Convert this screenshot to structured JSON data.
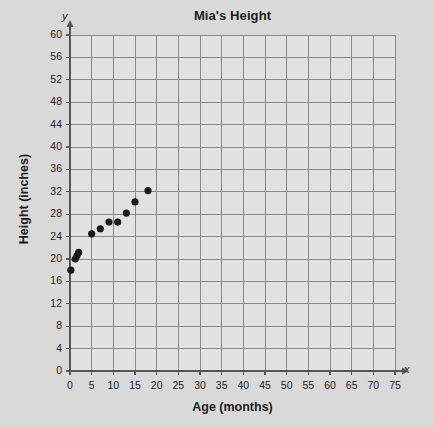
{
  "chart_data": {
    "type": "scatter",
    "title": "Mia's Height",
    "xlabel": "Age (months)",
    "ylabel": "Height (inches)",
    "xlim": [
      0,
      75
    ],
    "ylim": [
      0,
      60
    ],
    "xticks": [
      0,
      5,
      10,
      15,
      20,
      25,
      30,
      35,
      40,
      45,
      50,
      55,
      60,
      65,
      70,
      75
    ],
    "yticks": [
      0,
      4,
      8,
      12,
      16,
      20,
      24,
      28,
      32,
      36,
      40,
      44,
      48,
      52,
      56,
      60
    ],
    "grid": true,
    "legend": false,
    "x_axis_letter": "x",
    "y_axis_letter": "y",
    "series": [
      {
        "name": "Mia's Height",
        "marker_color": "#1a1a1a",
        "points": [
          {
            "x": 0.2,
            "y": 18.0
          },
          {
            "x": 1.2,
            "y": 20.0
          },
          {
            "x": 1.6,
            "y": 20.6
          },
          {
            "x": 2.0,
            "y": 21.2
          },
          {
            "x": 5.0,
            "y": 24.5
          },
          {
            "x": 7.0,
            "y": 25.4
          },
          {
            "x": 9.0,
            "y": 26.6
          },
          {
            "x": 11.0,
            "y": 26.6
          },
          {
            "x": 13.0,
            "y": 28.2
          },
          {
            "x": 15.0,
            "y": 30.2
          },
          {
            "x": 18.0,
            "y": 32.2
          }
        ]
      }
    ]
  },
  "colors": {
    "background": "#d9d9d9",
    "plot_background": "#e2e2e2",
    "grid": "#8a8a8a",
    "axis": "#555555",
    "marker": "#1a1a1a",
    "text": "#1c1c1c"
  }
}
